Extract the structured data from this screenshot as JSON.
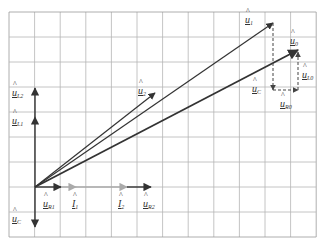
{
  "grid": {
    "x0": 9,
    "y0": 12,
    "cols": 12,
    "rows": 9,
    "cell_w": 25.6,
    "cell_h": 25,
    "line_color": "#b5b5b5",
    "border_color": "#9a9a9a"
  },
  "origin": {
    "x": 35,
    "y": 187
  },
  "colors": {
    "dark": "#333333",
    "current": "#aaaaaa",
    "dashed": "#444444"
  },
  "vectors": [
    {
      "id": "u_R1",
      "from": [
        35,
        187
      ],
      "to": [
        61,
        187
      ],
      "color": "dark",
      "width": 1.4
    },
    {
      "id": "I_1",
      "from": [
        61,
        187
      ],
      "to": [
        76,
        187
      ],
      "color": "current",
      "width": 1.4
    },
    {
      "id": "I_2",
      "from": [
        76,
        187
      ],
      "to": [
        127,
        187
      ],
      "color": "current",
      "width": 1.4
    },
    {
      "id": "u_R2",
      "from": [
        127,
        187
      ],
      "to": [
        151,
        187
      ],
      "color": "dark",
      "width": 1.4
    },
    {
      "id": "u_L1",
      "from": [
        35,
        187
      ],
      "to": [
        35,
        117
      ],
      "color": "dark",
      "width": 1.4
    },
    {
      "id": "u_L2",
      "from": [
        35,
        117
      ],
      "to": [
        35,
        88
      ],
      "color": "dark",
      "width": 1.4
    },
    {
      "id": "u_C",
      "from": [
        35,
        187
      ],
      "to": [
        35,
        227
      ],
      "color": "dark",
      "width": 1.4
    },
    {
      "id": "u_2",
      "from": [
        35,
        187
      ],
      "to": [
        155,
        93
      ],
      "color": "dark",
      "width": 1.2
    },
    {
      "id": "u_1",
      "from": [
        35,
        187
      ],
      "to": [
        273,
        23
      ],
      "color": "dark",
      "width": 1.2
    },
    {
      "id": "u_0",
      "from": [
        35,
        187
      ],
      "to": [
        298,
        50
      ],
      "color": "dark",
      "width": 1.8
    }
  ],
  "dashed_vectors": [
    {
      "id": "u_C_dash",
      "from": [
        273,
        23
      ],
      "to": [
        273,
        90
      ]
    },
    {
      "id": "u_R0_dash",
      "from": [
        273,
        90
      ],
      "to": [
        298,
        90
      ]
    },
    {
      "id": "u_L0_dash",
      "from": [
        298,
        90
      ],
      "to": [
        298,
        52
      ]
    }
  ],
  "labels": [
    {
      "id": "u_1",
      "base": "u",
      "sub": "1",
      "x": 245,
      "y": 15
    },
    {
      "id": "u_0",
      "base": "u",
      "sub": "0",
      "x": 290,
      "y": 36
    },
    {
      "id": "u_2",
      "base": "u",
      "sub": "2",
      "x": 138,
      "y": 86
    },
    {
      "id": "u_L0",
      "base": "u",
      "sub": "L0",
      "x": 302,
      "y": 70
    },
    {
      "id": "u_C_right",
      "base": "u",
      "sub": "C",
      "x": 252,
      "y": 84
    },
    {
      "id": "u_R0",
      "base": "u",
      "sub": "R0",
      "x": 280,
      "y": 99
    },
    {
      "id": "u_L2",
      "base": "u",
      "sub": "L2",
      "x": 12,
      "y": 88
    },
    {
      "id": "u_L1",
      "base": "u",
      "sub": "L1",
      "x": 12,
      "y": 116
    },
    {
      "id": "u_R1",
      "base": "u",
      "sub": "R1",
      "x": 43,
      "y": 199
    },
    {
      "id": "I_1",
      "base": "I",
      "sub": "1",
      "x": 72,
      "y": 199
    },
    {
      "id": "I_2",
      "base": "I",
      "sub": "2",
      "x": 118,
      "y": 199
    },
    {
      "id": "u_R2",
      "base": "u",
      "sub": "R2",
      "x": 143,
      "y": 199
    },
    {
      "id": "u_C_left",
      "base": "u",
      "sub": "C",
      "x": 12,
      "y": 214
    }
  ]
}
